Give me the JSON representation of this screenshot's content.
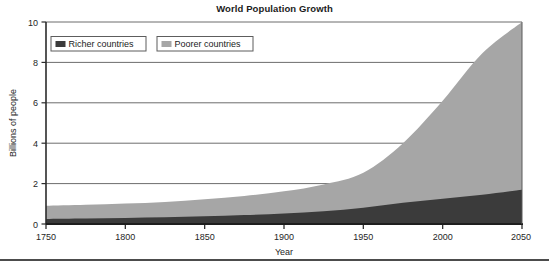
{
  "chart_data": {
    "type": "area",
    "title": "World Population Growth",
    "xlabel": "Year",
    "ylabel": "Billions of people",
    "xlim": [
      1750,
      2050
    ],
    "ylim": [
      0,
      10
    ],
    "xticks": [
      1750,
      1800,
      1850,
      1900,
      1950,
      2000,
      2050
    ],
    "yticks": [
      0,
      2,
      4,
      6,
      8,
      10
    ],
    "grid": "horizontal",
    "stacked": true,
    "legend_position": "top-left",
    "x": [
      1750,
      1775,
      1800,
      1825,
      1850,
      1875,
      1900,
      1925,
      1950,
      1975,
      2000,
      2025,
      2050
    ],
    "series": [
      {
        "name": "Richer countries",
        "color": "#3b3b3b",
        "values": [
          0.25,
          0.27,
          0.3,
          0.33,
          0.38,
          0.44,
          0.52,
          0.63,
          0.81,
          1.05,
          1.25,
          1.45,
          1.7
        ]
      },
      {
        "name": "Poorer countries",
        "color": "#a6a6a6",
        "values": [
          0.65,
          0.68,
          0.71,
          0.76,
          0.84,
          0.95,
          1.1,
          1.33,
          1.73,
          2.95,
          4.85,
          7.0,
          8.3
        ]
      }
    ],
    "totals": [
      0.9,
      0.95,
      1.01,
      1.09,
      1.22,
      1.39,
      1.62,
      1.96,
      2.54,
      4.0,
      6.1,
      8.45,
      10.0
    ]
  },
  "legend": {
    "items": [
      {
        "label": "Richer countries",
        "swatch": "#3b3b3b"
      },
      {
        "label": "Poorer countries",
        "swatch": "#a6a6a6"
      }
    ]
  },
  "axis": {
    "y_tick_labels": [
      "10",
      "8",
      "6",
      "4",
      "2",
      "0"
    ],
    "x_tick_labels": [
      "1750",
      "1800",
      "1850",
      "1900",
      "1950",
      "2000",
      "2050"
    ]
  }
}
